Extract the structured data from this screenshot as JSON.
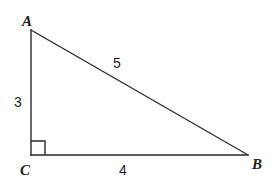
{
  "figure": {
    "kind": "right-triangle-diagram",
    "background_color": "#ffffff",
    "stroke_color": "#2a2a2a",
    "text_color": "#1d1d1d"
  },
  "vertices": {
    "a": {
      "label": "A",
      "x": 31,
      "y": 30
    },
    "c": {
      "label": "C",
      "x": 31,
      "y": 155
    },
    "b": {
      "label": "B",
      "x": 248,
      "y": 155
    }
  },
  "sides": {
    "leg_vertical": {
      "label": "3",
      "from": "A",
      "to": "C"
    },
    "leg_horizontal": {
      "label": "4",
      "from": "C",
      "to": "B"
    },
    "hypotenuse": {
      "label": "5",
      "from": "A",
      "to": "B"
    }
  },
  "right_angle": {
    "at": "C",
    "marker": "square",
    "size": 14
  }
}
